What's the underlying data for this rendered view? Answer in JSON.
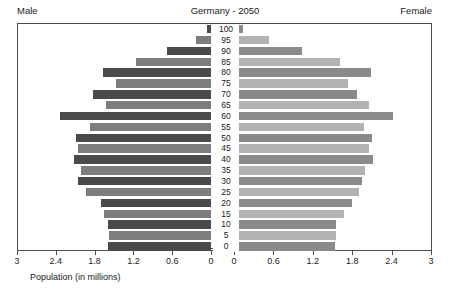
{
  "header": {
    "male_label": "Male",
    "title": "Germany - 2050",
    "female_label": "Female"
  },
  "axis": {
    "title": "Population (in millions)",
    "left_ticks": [
      "3",
      "2.4",
      "1.8",
      "1.2",
      "0.6",
      "0"
    ],
    "right_ticks": [
      "0",
      "0.6",
      "1.2",
      "1.8",
      "2.4",
      "3"
    ]
  },
  "colors": {
    "male_dark": "#4a4a4a",
    "male_light": "#7d7d7d",
    "female_dark": "#8a8a8a",
    "female_light": "#b3b3b3",
    "frame": "#4d4d4d",
    "background": "#ffffff"
  },
  "chart_data": {
    "type": "bar",
    "title": "Germany - 2050",
    "subtitle": "",
    "xlabel": "Population (in millions)",
    "ylabel": "Age",
    "xlim": [
      0,
      3
    ],
    "ylim": [
      0,
      100
    ],
    "grid": false,
    "legend": [
      "Male",
      "Female"
    ],
    "orientation": "population-pyramid",
    "categories": [
      "100",
      "95",
      "90",
      "85",
      "80",
      "75",
      "70",
      "65",
      "60",
      "55",
      "50",
      "45",
      "40",
      "35",
      "30",
      "25",
      "20",
      "15",
      "10",
      "5",
      "0"
    ],
    "series": [
      {
        "name": "Male",
        "side": "left",
        "values": [
          0.06,
          0.23,
          0.68,
          1.16,
          1.68,
          1.48,
          1.83,
          1.63,
          2.35,
          1.88,
          2.1,
          2.06,
          2.13,
          2.02,
          2.06,
          1.94,
          1.71,
          1.67,
          1.6,
          1.58,
          1.6
        ]
      },
      {
        "name": "Female",
        "side": "right",
        "values": [
          0.14,
          0.54,
          1.03,
          1.62,
          2.09,
          1.74,
          1.87,
          2.05,
          2.42,
          1.98,
          2.1,
          2.06,
          2.12,
          2.0,
          1.95,
          1.9,
          1.79,
          1.68,
          1.56,
          1.55,
          1.54
        ]
      }
    ]
  }
}
